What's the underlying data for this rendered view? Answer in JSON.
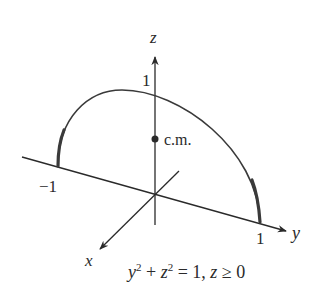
{
  "figure": {
    "axes": {
      "z": {
        "label": "z",
        "tick_label": "1"
      },
      "y": {
        "label": "y",
        "tick_neg_label": "−1",
        "tick_pos_label": "1"
      },
      "x": {
        "label": "x"
      }
    },
    "center_of_mass": {
      "label": "c.m."
    },
    "equation": {
      "y_var": "y",
      "y_exp": "2",
      "plus": " + ",
      "z_var": "z",
      "z_exp": "2",
      "rest": " = 1, ",
      "z_var2": "z",
      "cond": " ≥ 0"
    },
    "colors": {
      "stroke": "#2a2a2a",
      "curve": "#3a3a3a",
      "background": "#ffffff"
    }
  }
}
